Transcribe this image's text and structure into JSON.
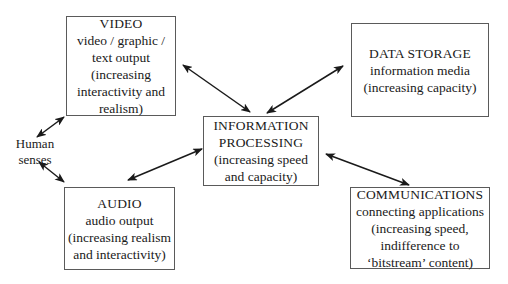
{
  "diagram": {
    "nodes": {
      "video": {
        "title": "VIDEO",
        "lines": [
          "video / graphic /",
          "text output",
          "(increasing",
          "interactivity and",
          "realism)"
        ]
      },
      "data_storage": {
        "title": "DATA STORAGE",
        "lines": [
          "information media",
          "(increasing capacity)"
        ]
      },
      "processing": {
        "title_lines": [
          "INFORMATION",
          "PROCESSING"
        ],
        "lines": [
          "(increasing speed",
          "and capacity)"
        ]
      },
      "audio": {
        "title": "AUDIO",
        "lines": [
          "audio output",
          "(increasing realism",
          "and interactivity)"
        ]
      },
      "communications": {
        "title": "COMMUNICATIONS",
        "lines": [
          "connecting applications",
          "(increasing speed,",
          "indifference to",
          "‘bitstream’ content)"
        ]
      }
    },
    "human_senses": {
      "lines": [
        "Human",
        "senses"
      ]
    },
    "edges": [
      {
        "from": "video",
        "to": "processing",
        "type": "bidirectional"
      },
      {
        "from": "data_storage",
        "to": "processing",
        "type": "bidirectional"
      },
      {
        "from": "audio",
        "to": "processing",
        "type": "bidirectional"
      },
      {
        "from": "communications",
        "to": "processing",
        "type": "bidirectional"
      },
      {
        "from": "human_senses",
        "to": "video",
        "type": "bidirectional"
      },
      {
        "from": "human_senses",
        "to": "audio",
        "type": "bidirectional"
      }
    ],
    "colors": {
      "line": "#1a1a1a",
      "border": "#5a5a5a",
      "background": "#ffffff"
    }
  }
}
